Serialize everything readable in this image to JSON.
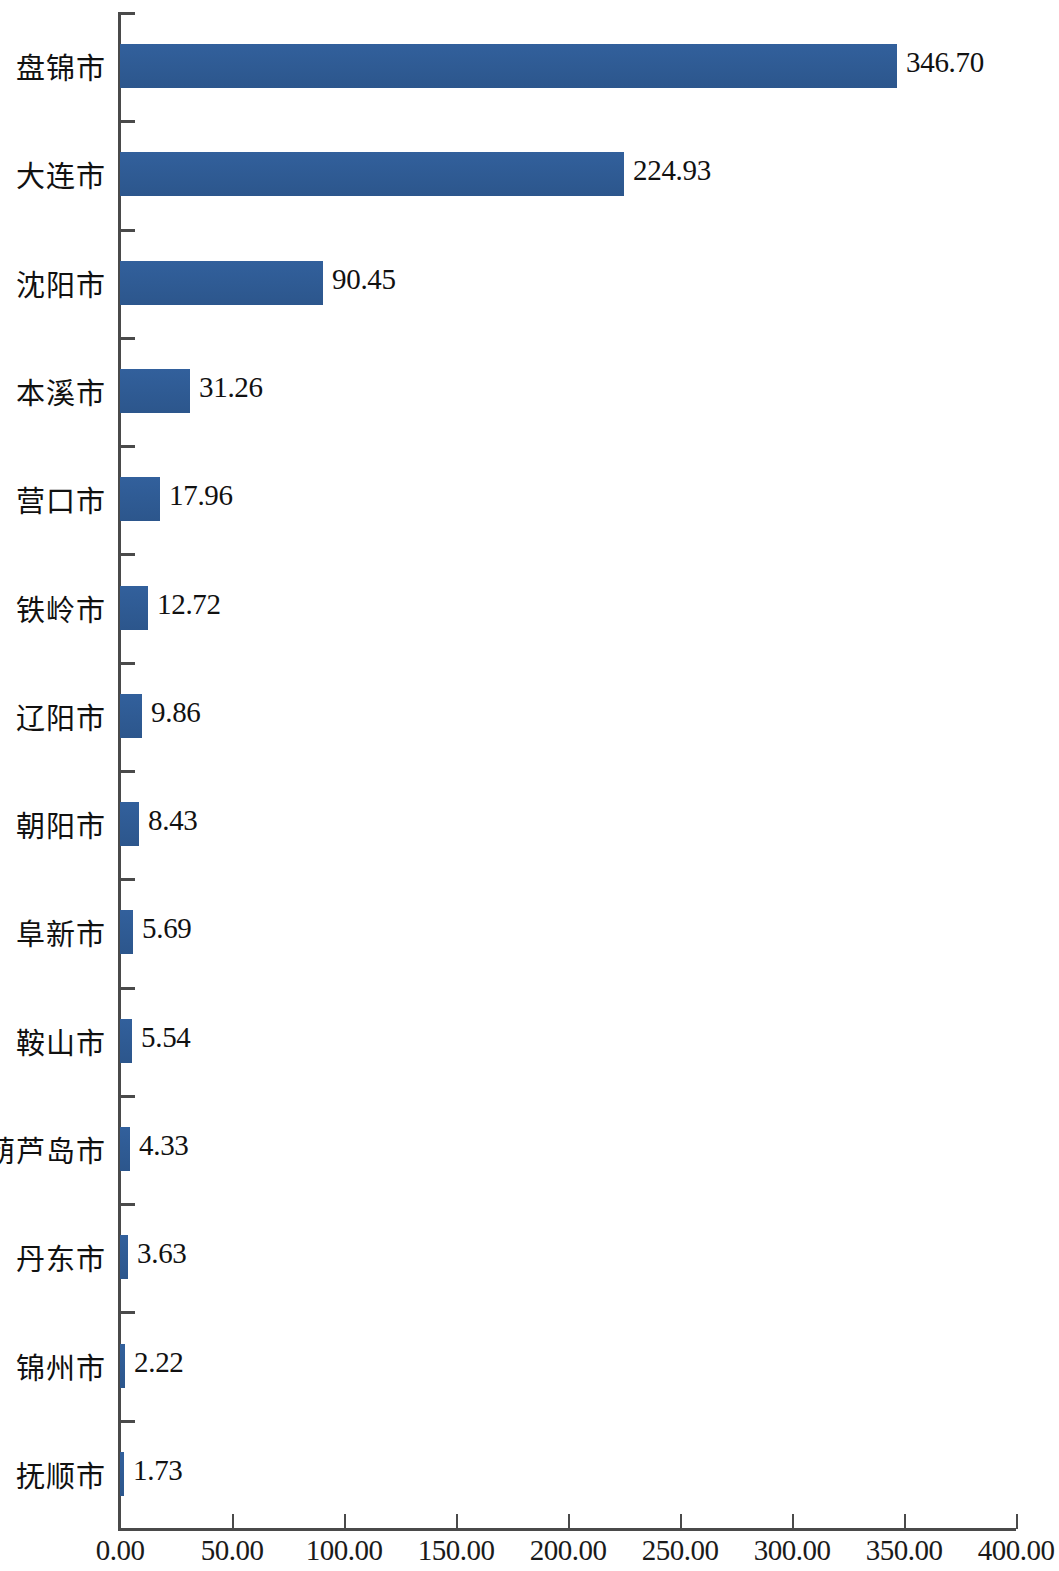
{
  "chart_data": {
    "type": "bar",
    "orientation": "horizontal",
    "title": "",
    "subtitle": "",
    "xlabel": "",
    "ylabel": "",
    "xlim": [
      0,
      400
    ],
    "xticks": [
      "0.00",
      "50.00",
      "100.00",
      "150.00",
      "200.00",
      "250.00",
      "300.00",
      "350.00",
      "400.00"
    ],
    "xtick_values": [
      0,
      50,
      100,
      150,
      200,
      250,
      300,
      350,
      400
    ],
    "grid": false,
    "legend": false,
    "legend_position": "none",
    "bar_color": "#2f5c96",
    "axis_color": "#4a4a4a",
    "background_color": "#ffffff",
    "categories": [
      "盘锦市",
      "大连市",
      "沈阳市",
      "本溪市",
      "营口市",
      "铁岭市",
      "辽阳市",
      "朝阳市",
      "阜新市",
      "鞍山市",
      "葫芦岛市",
      "丹东市",
      "锦州市",
      "抚顺市"
    ],
    "values": [
      346.7,
      224.93,
      90.45,
      31.26,
      17.96,
      12.72,
      9.86,
      8.43,
      5.69,
      5.54,
      4.33,
      3.63,
      2.22,
      1.73
    ],
    "value_labels": [
      "346.70",
      "224.93",
      "90.45",
      "31.26",
      "17.96",
      "12.72",
      "9.86",
      "8.43",
      "5.69",
      "5.54",
      "4.33",
      "3.63",
      "2.22",
      "1.73"
    ],
    "bars": [
      {
        "category": "盘锦市",
        "value": 346.7,
        "label": "346.70"
      },
      {
        "category": "大连市",
        "value": 224.93,
        "label": "224.93"
      },
      {
        "category": "沈阳市",
        "value": 90.45,
        "label": "90.45"
      },
      {
        "category": "本溪市",
        "value": 31.26,
        "label": "31.26"
      },
      {
        "category": "营口市",
        "value": 17.96,
        "label": "17.96"
      },
      {
        "category": "铁岭市",
        "value": 12.72,
        "label": "12.72"
      },
      {
        "category": "辽阳市",
        "value": 9.86,
        "label": "9.86"
      },
      {
        "category": "朝阳市",
        "value": 8.43,
        "label": "8.43"
      },
      {
        "category": "阜新市",
        "value": 5.69,
        "label": "5.69"
      },
      {
        "category": "鞍山市",
        "value": 5.54,
        "label": "5.54"
      },
      {
        "category": "葫芦岛市",
        "value": 4.33,
        "label": "4.33"
      },
      {
        "category": "丹东市",
        "value": 3.63,
        "label": "3.63"
      },
      {
        "category": "锦州市",
        "value": 2.22,
        "label": "2.22"
      },
      {
        "category": "抚顺市",
        "value": 1.73,
        "label": "1.73"
      }
    ]
  }
}
